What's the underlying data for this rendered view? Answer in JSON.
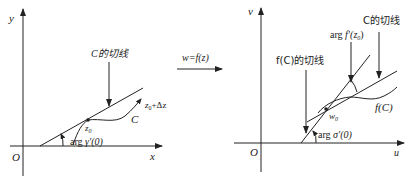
{
  "diagram": {
    "type": "conformal-mapping-illustration",
    "colors": {
      "stroke": "#222222",
      "background": "#ffffff"
    },
    "left_panel": {
      "axis_x_label": "x",
      "axis_y_label": "y",
      "origin_label": "O",
      "tangent_label": "C的切线",
      "curve_label": "C",
      "point_label": "z",
      "point_sub": "0",
      "moved_point_label": "z",
      "moved_point_sub": "0",
      "moved_point_suffix": "+Δz",
      "angle_label_prefix": "arg ",
      "angle_label_func": "γ′(0)"
    },
    "mapping": {
      "label": "w=f(z)"
    },
    "right_panel": {
      "axis_x_label": "u",
      "axis_y_label": "v",
      "origin_label": "O",
      "tangent_C_label": "C的切线",
      "tangent_fC_label": "f(C)的切线",
      "curve_label": "f(C)",
      "point_label": "w",
      "point_sub": "0",
      "rotation_label_prefix": "arg ",
      "rotation_label_func": "f′(z",
      "rotation_label_sub": "0",
      "rotation_label_suffix": ")",
      "angle_label_prefix": "arg ",
      "angle_label_func": "σ′(0)"
    }
  }
}
